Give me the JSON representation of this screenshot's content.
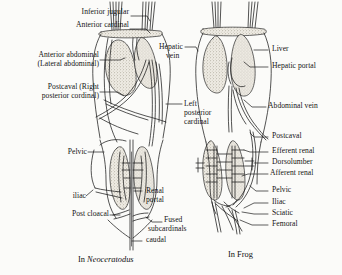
{
  "figure": {
    "title_left": "In Neoceratodus",
    "title_left_prefix": "In ",
    "title_left_taxon": "Neoceratodus",
    "title_right": "In Frog",
    "background_color": "#fbfbf9",
    "ink_color": "#141414",
    "stipple_color": "#8d8778"
  },
  "labels_left": [
    {
      "id": "inferior-jugular",
      "text": "Inferior jugular",
      "x": 66,
      "y": 12
    },
    {
      "id": "anterior-cardinal",
      "text": "Anterior cardinal",
      "x": 64,
      "y": 25
    },
    {
      "id": "anterior-abdominal",
      "text": "Anterior abdominal",
      "x": 12,
      "y": 53
    },
    {
      "id": "lateral-abdominal",
      "text": "(Lateral abdominal)",
      "x": 12,
      "y": 62
    },
    {
      "id": "postcaval-right",
      "text": "Postcaval (Right",
      "x": 14,
      "y": 86
    },
    {
      "id": "posterior-cordinal",
      "text": "posterior cordinal)",
      "x": 12,
      "y": 95
    },
    {
      "id": "pelvic-left",
      "text": "Pelvic",
      "x": 62,
      "y": 149
    },
    {
      "id": "iliac-left",
      "text": "iliac",
      "x": 80,
      "y": 197
    },
    {
      "id": "post-cloacal",
      "text": "Post cloacal",
      "x": 68,
      "y": 212
    }
  ],
  "labels_center": [
    {
      "id": "hepatic-vein-1",
      "text": "Hepatic",
      "x": 159,
      "y": 44
    },
    {
      "id": "hepatic-vein-2",
      "text": "vein",
      "x": 166,
      "y": 53
    },
    {
      "id": "left-posterior-1",
      "text": "Left",
      "x": 184,
      "y": 101
    },
    {
      "id": "left-posterior-2",
      "text": "posterior",
      "x": 184,
      "y": 110
    },
    {
      "id": "left-posterior-3",
      "text": "cardinal",
      "x": 184,
      "y": 119
    },
    {
      "id": "renal-portal-1",
      "text": "Renal",
      "x": 148,
      "y": 188
    },
    {
      "id": "renal-portal-2",
      "text": "portal",
      "x": 148,
      "y": 197
    },
    {
      "id": "fused-subcardinals-1",
      "text": "Fused",
      "x": 134,
      "y": 217
    },
    {
      "id": "fused-subcardinals-2",
      "text": "subcardinals",
      "x": 118,
      "y": 226
    },
    {
      "id": "caudal",
      "text": "caudal",
      "x": 144,
      "y": 238
    }
  ],
  "labels_right": [
    {
      "id": "liver",
      "text": "Liver",
      "x": 272,
      "y": 47
    },
    {
      "id": "hepatic-portal",
      "text": "Hepatic portal",
      "x": 272,
      "y": 64
    },
    {
      "id": "abdominal-vein",
      "text": "Abdominal vein",
      "x": 268,
      "y": 104
    },
    {
      "id": "postcaval-frog",
      "text": "Postcaval",
      "x": 272,
      "y": 134
    },
    {
      "id": "efferent-renal",
      "text": "Efferent renal",
      "x": 272,
      "y": 149
    },
    {
      "id": "dorsolumber",
      "text": "Dorsolumber",
      "x": 272,
      "y": 160
    },
    {
      "id": "afferent-renal",
      "text": "Afferent renal",
      "x": 270,
      "y": 171
    },
    {
      "id": "pelvic-frog",
      "text": "Pelvic",
      "x": 272,
      "y": 188
    },
    {
      "id": "iliac-frog",
      "text": "Iliac",
      "x": 272,
      "y": 200
    },
    {
      "id": "sciatic",
      "text": "Sciatic",
      "x": 272,
      "y": 211
    },
    {
      "id": "femoral",
      "text": "Femoral",
      "x": 272,
      "y": 222
    }
  ],
  "captions": [
    {
      "id": "caption-neoceratodus",
      "x": 78,
      "y": 257
    },
    {
      "id": "caption-frog",
      "text": "In Frog",
      "x": 228,
      "y": 252
    }
  ]
}
